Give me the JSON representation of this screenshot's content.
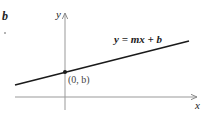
{
  "diagram": {
    "equation_label": "y = mx + b",
    "intercept_label": "(0, b)",
    "x_axis_label": "x",
    "y_axis_label": "y",
    "cropped_fragment": "b",
    "colors": {
      "line": "#1a1a1a",
      "axes": "#888888",
      "text": "#222222"
    }
  }
}
